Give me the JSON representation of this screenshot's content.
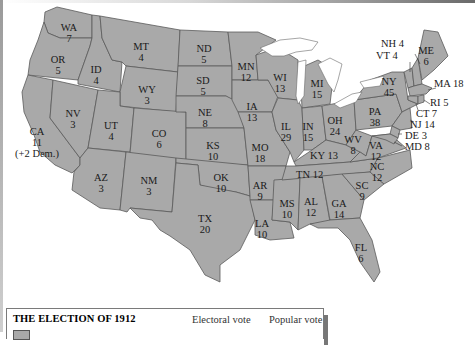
{
  "map": {
    "title": "THE ELECTION OF 1912",
    "fill_color": "#a9a9a9",
    "border_color": "#5a5a5a",
    "states": [
      {
        "abbr": "WA",
        "votes": "7"
      },
      {
        "abbr": "OR",
        "votes": "5"
      },
      {
        "abbr": "CA",
        "votes": "11",
        "note": "(+2 Dem.)"
      },
      {
        "abbr": "ID",
        "votes": "4"
      },
      {
        "abbr": "NV",
        "votes": "3"
      },
      {
        "abbr": "MT",
        "votes": "4"
      },
      {
        "abbr": "WY",
        "votes": "3"
      },
      {
        "abbr": "UT",
        "votes": "4"
      },
      {
        "abbr": "AZ",
        "votes": "3"
      },
      {
        "abbr": "CO",
        "votes": "6"
      },
      {
        "abbr": "NM",
        "votes": "3"
      },
      {
        "abbr": "ND",
        "votes": "5"
      },
      {
        "abbr": "SD",
        "votes": "5"
      },
      {
        "abbr": "NE",
        "votes": "8"
      },
      {
        "abbr": "KS",
        "votes": "10"
      },
      {
        "abbr": "OK",
        "votes": "10"
      },
      {
        "abbr": "TX",
        "votes": "20"
      },
      {
        "abbr": "MN",
        "votes": "12"
      },
      {
        "abbr": "IA",
        "votes": "13"
      },
      {
        "abbr": "MO",
        "votes": "18"
      },
      {
        "abbr": "AR",
        "votes": "9"
      },
      {
        "abbr": "LA",
        "votes": "10"
      },
      {
        "abbr": "WI",
        "votes": "13"
      },
      {
        "abbr": "IL",
        "votes": "29"
      },
      {
        "abbr": "MS",
        "votes": "10"
      },
      {
        "abbr": "MI",
        "votes": "15"
      },
      {
        "abbr": "IN",
        "votes": "15"
      },
      {
        "abbr": "KY",
        "votes": "13"
      },
      {
        "abbr": "TN",
        "votes": "12"
      },
      {
        "abbr": "AL",
        "votes": "12"
      },
      {
        "abbr": "OH",
        "votes": "24"
      },
      {
        "abbr": "WV",
        "votes": "8"
      },
      {
        "abbr": "GA",
        "votes": "14"
      },
      {
        "abbr": "FL",
        "votes": "6"
      },
      {
        "abbr": "SC",
        "votes": "9"
      },
      {
        "abbr": "NC",
        "votes": "12"
      },
      {
        "abbr": "VA",
        "votes": "12"
      },
      {
        "abbr": "PA",
        "votes": "38"
      },
      {
        "abbr": "NY",
        "votes": "45"
      },
      {
        "abbr": "ME",
        "votes": "6"
      },
      {
        "abbr": "NH",
        "votes": "4"
      },
      {
        "abbr": "VT",
        "votes": "4"
      },
      {
        "abbr": "MA",
        "votes": "18"
      },
      {
        "abbr": "RI",
        "votes": "5"
      },
      {
        "abbr": "CT",
        "votes": "7"
      },
      {
        "abbr": "NJ",
        "votes": "14"
      },
      {
        "abbr": "DE",
        "votes": "3"
      },
      {
        "abbr": "MD",
        "votes": "8"
      }
    ]
  },
  "legend": {
    "title": "THE ELECTION OF 1912",
    "col_electoral": "Electoral vote",
    "col_popular": "Popular vote"
  }
}
